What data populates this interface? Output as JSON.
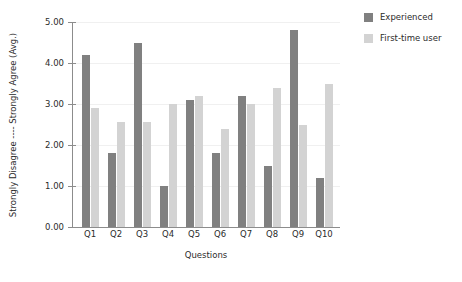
{
  "chart_data": {
    "type": "bar",
    "title": "",
    "xlabel": "Questions",
    "ylabel": "Strongly Disagree ---- Strongly Agree  (Avg.)",
    "categories": [
      "Q1",
      "Q2",
      "Q3",
      "Q4",
      "Q5",
      "Q6",
      "Q7",
      "Q8",
      "Q9",
      "Q10"
    ],
    "series": [
      {
        "name": "Experienced",
        "color": "#808080",
        "values": [
          4.2,
          1.8,
          4.5,
          1.0,
          3.1,
          1.8,
          3.2,
          1.5,
          4.8,
          1.2
        ]
      },
      {
        "name": "First-time user",
        "color": "#d3d3d3",
        "values": [
          2.9,
          2.55,
          2.55,
          3.0,
          3.2,
          2.4,
          3.0,
          3.4,
          2.5,
          3.5
        ]
      }
    ],
    "ylim": [
      0.0,
      5.0
    ],
    "yticks": [
      "0.00",
      "1.00",
      "2.00",
      "3.00",
      "4.00",
      "5.00"
    ],
    "ytick_values": [
      0.0,
      1.0,
      2.0,
      3.0,
      4.0,
      5.0
    ],
    "grid": true,
    "legend_position": "upper right",
    "background_color": "#ffffff",
    "axis_color": "#8c8c8c",
    "grid_color": "#f0f0f0"
  }
}
